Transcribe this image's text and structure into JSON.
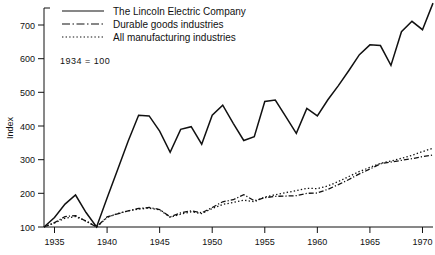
{
  "chart_data": {
    "type": "line",
    "title": "",
    "subtitle": "",
    "xlabel": "",
    "ylabel": "Index",
    "annotation": "1934 = 100",
    "grid": false,
    "legend_position": "top-left-inside",
    "xlim": [
      1934,
      1971
    ],
    "ylim": [
      100,
      760
    ],
    "xticks": [
      1935,
      1940,
      1945,
      1950,
      1955,
      1960,
      1965,
      1970
    ],
    "xtick_labels": [
      "1935",
      "1940",
      "1945",
      "1950",
      "1955",
      "1960",
      "1965",
      "1970"
    ],
    "yticks": [
      100,
      200,
      300,
      400,
      500,
      600,
      700
    ],
    "ytick_labels": [
      "100",
      "200",
      "300",
      "400",
      "500",
      "600",
      "700"
    ],
    "x": [
      1934,
      1935,
      1936,
      1937,
      1938,
      1939,
      1940,
      1941,
      1942,
      1943,
      1944,
      1945,
      1946,
      1947,
      1948,
      1949,
      1950,
      1951,
      1952,
      1953,
      1954,
      1955,
      1956,
      1957,
      1958,
      1959,
      1960,
      1961,
      1962,
      1963,
      1964,
      1965,
      1966,
      1967,
      1968,
      1969,
      1970,
      1971
    ],
    "series": [
      {
        "name": "The Lincoln Electric Company",
        "style": "solid",
        "values": [
          100,
          128,
          168,
          195,
          143,
          100,
          186,
          270,
          355,
          432,
          430,
          385,
          322,
          390,
          398,
          346,
          432,
          462,
          408,
          357,
          368,
          473,
          477,
          428,
          378,
          452,
          430,
          478,
          520,
          565,
          612,
          641,
          639,
          580,
          680,
          711,
          686,
          765
        ]
      },
      {
        "name": "Durable goods industries",
        "style": "dashdot",
        "values": [
          100,
          113,
          131,
          134,
          117,
          100,
          130,
          139,
          148,
          155,
          158,
          152,
          130,
          142,
          148,
          142,
          158,
          175,
          181,
          196,
          178,
          187,
          191,
          192,
          193,
          200,
          201,
          212,
          226,
          241,
          258,
          272,
          288,
          293,
          298,
          303,
          309,
          314
        ]
      },
      {
        "name": "All manufacturing industries",
        "style": "dotted",
        "values": [
          100,
          112,
          126,
          131,
          118,
          100,
          128,
          140,
          148,
          153,
          156,
          151,
          129,
          138,
          145,
          140,
          155,
          167,
          173,
          180,
          175,
          189,
          196,
          202,
          208,
          215,
          214,
          222,
          235,
          250,
          265,
          277,
          289,
          296,
          304,
          313,
          324,
          334
        ]
      }
    ]
  },
  "legend": {
    "items": [
      {
        "label": "The Lincoln Electric Company",
        "style": "solid"
      },
      {
        "label": "Durable goods industries",
        "style": "dashdot"
      },
      {
        "label": "All manufacturing industries",
        "style": "dotted"
      }
    ]
  },
  "axes": {
    "y_title": "Index",
    "note": "1934 = 100"
  }
}
